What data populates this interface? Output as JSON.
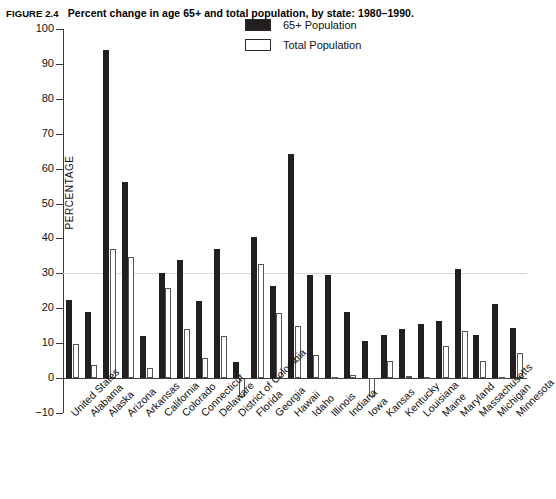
{
  "figure": {
    "number": "FIGURE 2.4",
    "title": "Percent change in age 65+ and total population, by state: 1980–1990."
  },
  "axes": {
    "y_title": "PERCENTAGE",
    "y_ticks": [
      "100",
      "90",
      "80",
      "70",
      "60",
      "50",
      "40",
      "30",
      "20",
      "10",
      "0",
      "−10"
    ]
  },
  "legend": {
    "items": [
      {
        "label": "65+ Population",
        "swatch": "filled",
        "color": "#231f20"
      },
      {
        "label": "Total Population",
        "swatch": "hollow",
        "color": "#ffffff"
      }
    ]
  },
  "chart_data": {
    "type": "bar",
    "title": "Percent change in age 65+ and total population, by state: 1980–1990.",
    "xlabel": "",
    "ylabel": "PERCENTAGE",
    "ylim": [
      -10,
      100
    ],
    "ytick_step": 10,
    "grid": "single gridline at 30",
    "legend_position": "top-center",
    "categories": [
      "United States",
      "Alabama",
      "Alaska",
      "Arizona",
      "Arkansas",
      "California",
      "Colorado",
      "Connecticut",
      "Delaware",
      "District of Colombia",
      "Florida",
      "Georgia",
      "Hawaii",
      "Idaho",
      "Illinois",
      "Indiana",
      "Iowa",
      "Kansas",
      "Kentucky",
      "Louisiana",
      "Maine",
      "Maryland",
      "Massachusetts",
      "Michigan",
      "Minnesota"
    ],
    "series": [
      {
        "name": "65+ Population",
        "color": "#231f20",
        "values": [
          22.3,
          18.8,
          94.1,
          56.1,
          12.0,
          30.2,
          33.9,
          22.1,
          37.0,
          4.6,
          40.5,
          26.3,
          64.3,
          29.5,
          29.4,
          18.8,
          10.6,
          12.2,
          13.9,
          15.4,
          16.2,
          31.1,
          12.3,
          21.3,
          14.3
        ]
      },
      {
        "name": "Total Population",
        "color": "#ffffff",
        "values": [
          9.8,
          3.8,
          36.9,
          34.8,
          2.8,
          25.7,
          14.0,
          5.8,
          12.1,
          -5.4,
          32.7,
          18.6,
          14.9,
          6.7,
          0.0,
          1.0,
          -5.4,
          4.8,
          0.7,
          0.3,
          9.2,
          13.4,
          4.9,
          0.4,
          7.3
        ]
      }
    ]
  }
}
